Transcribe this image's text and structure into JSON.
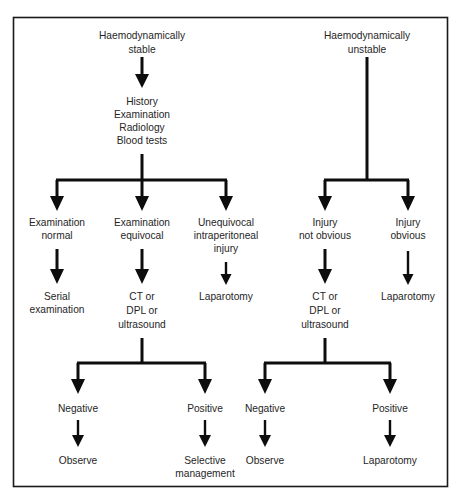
{
  "figure": {
    "type": "flowchart",
    "orientation": "top-down",
    "border_color": "#1a1a1a",
    "line_color": "#0d0d0d",
    "text_color": "#262626",
    "background_color": "#ffffff"
  },
  "nodes": {
    "haemodynamically_stable": "Haemodynamically\nstable",
    "haemodynamically_stable_l1": "Haemodynamically",
    "haemodynamically_stable_l2": "stable",
    "haemodynamically_unstable_l1": "Haemodynamically",
    "haemodynamically_unstable_l2": "unstable",
    "workup_l1": "History",
    "workup_l2": "Examination",
    "workup_l3": "Radiology",
    "workup_l4": "Blood tests",
    "exam_normal_l1": "Examination",
    "exam_normal_l2": "normal",
    "exam_equivocal_l1": "Examination",
    "exam_equivocal_l2": "equivocal",
    "unequivocal_l1": "Unequivocal",
    "unequivocal_l2": "intraperitoneal",
    "unequivocal_l3": "injury",
    "injury_not_obvious_l1": "Injury",
    "injury_not_obvious_l2": "not obvious",
    "injury_obvious_l1": "Injury",
    "injury_obvious_l2": "obvious",
    "serial_exam_l1": "Serial",
    "serial_exam_l2": "examination",
    "ct_dpl_us_left_l1": "CT or",
    "ct_dpl_us_left_l2": "DPL or",
    "ct_dpl_us_left_l3": "ultrasound",
    "laparotomy_mid": "Laparotomy",
    "ct_dpl_us_right_l1": "CT or",
    "ct_dpl_us_right_l2": "DPL or",
    "ct_dpl_us_right_l3": "ultrasound",
    "laparotomy_right": "Laparotomy",
    "negative_left": "Negative",
    "positive_left": "Positive",
    "negative_right": "Negative",
    "positive_right": "Positive",
    "observe_left": "Observe",
    "selective_mgmt_l1": "Selective",
    "selective_mgmt_l2": "management",
    "observe_right": "Observe",
    "laparotomy_bottom": "Laparotomy"
  },
  "edges": [
    {
      "from": "haemodynamically_stable",
      "to": "workup",
      "style": "arrow-down"
    },
    {
      "from": "workup",
      "to": "split_left_3way",
      "style": "line-down"
    },
    {
      "from": "split_left_3way",
      "to": "exam_normal",
      "style": "arrow-down"
    },
    {
      "from": "split_left_3way",
      "to": "exam_equivocal",
      "style": "arrow-down"
    },
    {
      "from": "split_left_3way",
      "to": "unequivocal",
      "style": "arrow-down"
    },
    {
      "from": "haemodynamically_unstable",
      "to": "split_right_2way",
      "style": "line-down"
    },
    {
      "from": "split_right_2way",
      "to": "injury_not_obvious",
      "style": "arrow-down"
    },
    {
      "from": "split_right_2way",
      "to": "injury_obvious",
      "style": "arrow-down"
    },
    {
      "from": "exam_normal",
      "to": "serial_exam",
      "style": "arrow-down"
    },
    {
      "from": "exam_equivocal",
      "to": "ct_dpl_us_left",
      "style": "arrow-down"
    },
    {
      "from": "unequivocal",
      "to": "laparotomy_mid",
      "style": "arrow-down"
    },
    {
      "from": "injury_not_obvious",
      "to": "ct_dpl_us_right",
      "style": "arrow-down"
    },
    {
      "from": "injury_obvious",
      "to": "laparotomy_right",
      "style": "arrow-down"
    },
    {
      "from": "ct_dpl_us_left",
      "to": "split_bottom_left",
      "style": "line-down"
    },
    {
      "from": "split_bottom_left",
      "to": "negative_left",
      "style": "arrow-down"
    },
    {
      "from": "split_bottom_left",
      "to": "positive_left",
      "style": "arrow-down"
    },
    {
      "from": "ct_dpl_us_right",
      "to": "split_bottom_right",
      "style": "line-down"
    },
    {
      "from": "split_bottom_right",
      "to": "negative_right",
      "style": "arrow-down"
    },
    {
      "from": "split_bottom_right",
      "to": "positive_right",
      "style": "arrow-down"
    },
    {
      "from": "negative_left",
      "to": "observe_left",
      "style": "arrow-down"
    },
    {
      "from": "positive_left",
      "to": "selective_mgmt",
      "style": "arrow-down"
    },
    {
      "from": "negative_right",
      "to": "observe_right",
      "style": "arrow-down"
    },
    {
      "from": "positive_right",
      "to": "laparotomy_bottom",
      "style": "arrow-down"
    }
  ]
}
